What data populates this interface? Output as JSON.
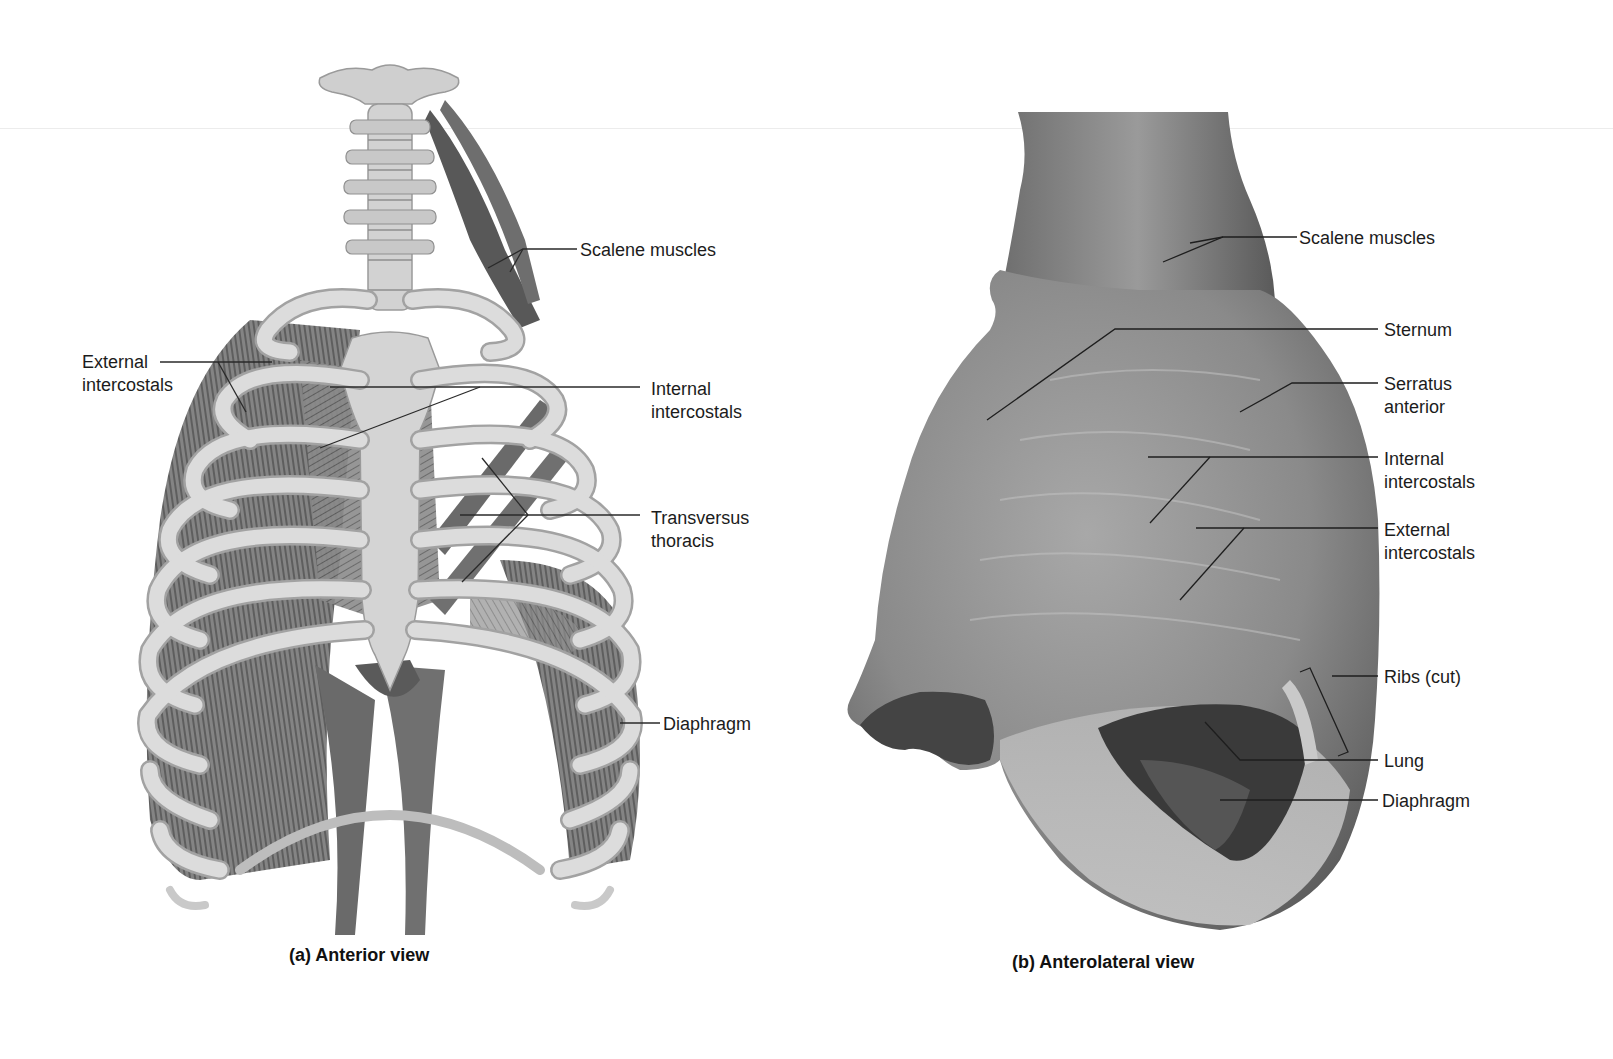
{
  "figure": {
    "panel_a": {
      "caption": "(a) Anterior view",
      "subject": "rib-cage-illustration",
      "labels": [
        {
          "id": "scalene",
          "text": "Scalene muscles"
        },
        {
          "id": "external-intercostals",
          "text": "External\nintercostals"
        },
        {
          "id": "internal-intercostals",
          "text": "Internal\nintercostals"
        },
        {
          "id": "transversus-thoracis",
          "text": "Transversus\nthoracis"
        },
        {
          "id": "diaphragm",
          "text": "Diaphragm"
        }
      ]
    },
    "panel_b": {
      "caption": "(b) Anterolateral view",
      "subject": "cadaver-dissection-photo",
      "labels": [
        {
          "id": "scalene",
          "text": "Scalene muscles"
        },
        {
          "id": "sternum",
          "text": "Sternum"
        },
        {
          "id": "serratus-anterior",
          "text": "Serratus\nanterior"
        },
        {
          "id": "internal-intercostals",
          "text": "Internal\nintercostals"
        },
        {
          "id": "external-intercostals",
          "text": "External\nintercostals"
        },
        {
          "id": "ribs-cut",
          "text": "Ribs (cut)"
        },
        {
          "id": "lung",
          "text": "Lung"
        },
        {
          "id": "diaphragm",
          "text": "Diaphragm"
        }
      ]
    }
  },
  "colors": {
    "bone": "#d9d9d9",
    "bone_edge": "#9a9a9a",
    "muscle": "#7a7a7a",
    "muscle_dark": "#4a4a4a",
    "tissue": "#8c8c8c",
    "leader_line": "#2a2a2a"
  }
}
